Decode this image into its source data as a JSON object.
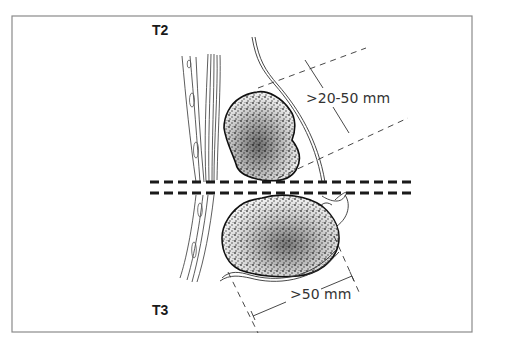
{
  "figure": {
    "frame_color": "#8a8a8a",
    "panels": [
      {
        "id": "t2",
        "stage_label": "T2",
        "dimension_label": ">20-50 mm"
      },
      {
        "id": "t3",
        "stage_label": "T3",
        "dimension_label": ">50 mm"
      }
    ],
    "separator": {
      "style": "double-dashed",
      "color": "#1a1a1a"
    }
  }
}
